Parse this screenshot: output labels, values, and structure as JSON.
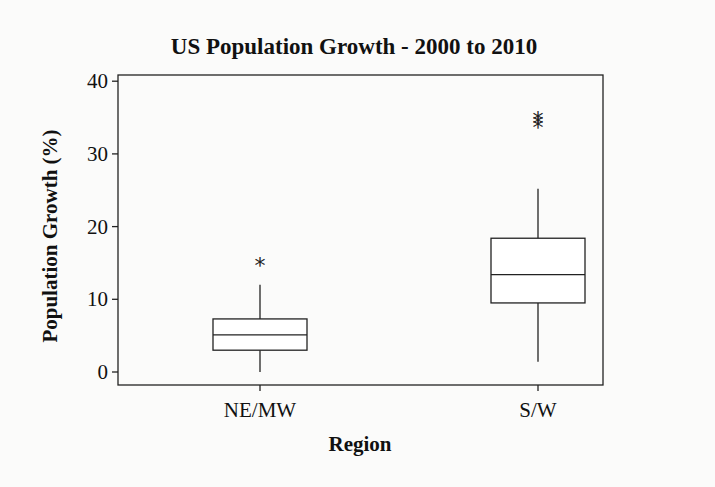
{
  "chart_data": {
    "type": "boxplot",
    "title": "US Population Growth - 2000 to 2010",
    "xlabel": "Region",
    "ylabel": "Population Growth (%)",
    "ylim": [
      0,
      40
    ],
    "yticks": [
      0,
      10,
      20,
      30,
      40
    ],
    "categories": [
      "NE/MW",
      "S/W"
    ],
    "series": [
      {
        "name": "NE/MW",
        "whisker_low": 0,
        "q1": 3.0,
        "median": 5.1,
        "q3": 7.3,
        "whisker_high": 12.0,
        "outliers": [
          15.0
        ]
      },
      {
        "name": "S/W",
        "whisker_low": 1.4,
        "q1": 9.5,
        "median": 13.4,
        "q3": 18.4,
        "whisker_high": 25.2,
        "outliers": [
          34.0,
          34.5,
          35.1
        ]
      }
    ],
    "grid": false,
    "legend": null
  }
}
